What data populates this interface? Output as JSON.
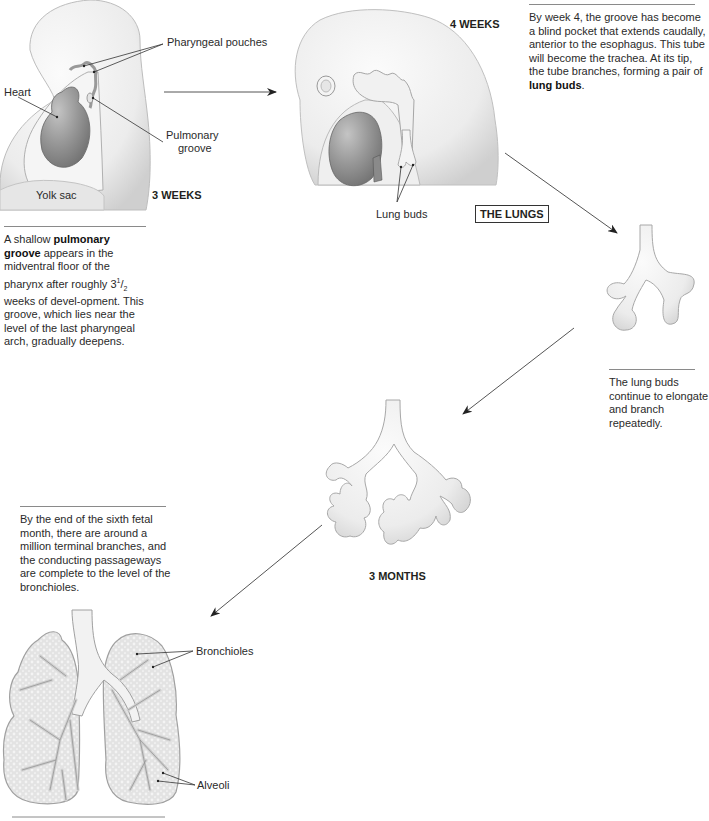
{
  "title": "THE LUNGS",
  "stages": {
    "week3": {
      "stage_label": "3 WEEKS",
      "labels": {
        "pharyngeal_pouches": "Pharyngeal pouches",
        "heart": "Heart",
        "pulmonary_groove_1": "Pulmonary",
        "pulmonary_groove_2": "groove",
        "yolk_sac": "Yolk sac"
      },
      "caption": {
        "pre": "A shallow ",
        "bold": "pulmonary groove",
        "line1": " appears in the midventral floor of the pharynx after roughly 3",
        "sup": "1",
        "slash": "/",
        "sub": "2",
        "rest": " weeks of devel-opment. This groove, which lies near the level of the last pharyngeal arch, gradually deepens."
      }
    },
    "week4": {
      "stage_label": "4 WEEKS",
      "labels": {
        "lung_buds": "Lung buds"
      },
      "caption": {
        "text": "By week 4, the groove has become a blind pocket that extends caudally, anterior to the esophagus. This tube will become the trachea. At its tip, the tube branches, forming a pair of ",
        "bold": "lung buds",
        "end": "."
      }
    },
    "branching": {
      "caption": "The lung buds continue to elongate and branch repeatedly."
    },
    "month3": {
      "stage_label": "3 MONTHS"
    },
    "month6": {
      "caption": "By the end of the sixth fetal month, there are around a million terminal branches, and the conducting passageways are complete to the level of the bronchioles.",
      "labels": {
        "bronchioles": "Bronchioles",
        "alveoli": "Alveoli"
      }
    }
  },
  "colors": {
    "tissue": "#ececec",
    "tissue_shade": "#d2d2d2",
    "heart": "#8e8e8e",
    "outline": "#9a9a9a",
    "arrow": "#444444"
  }
}
